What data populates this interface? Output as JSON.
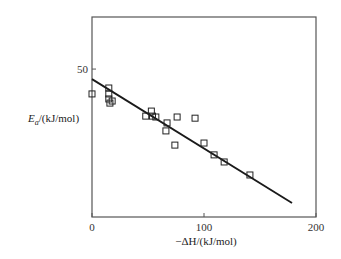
{
  "chart_data": {
    "type": "scatter",
    "title": "",
    "xlabel": "−ΔH/(kJ/mol)",
    "ylabel_main": "E",
    "ylabel_sub": "a",
    "ylabel_rest": "/(kJ/mol)",
    "xlim": [
      0,
      200
    ],
    "ylim": [
      0,
      67.6
    ],
    "x_ticks": [
      0,
      100,
      200
    ],
    "x_tick_labels": [
      "0",
      "100",
      "200"
    ],
    "y_ticks": [
      50
    ],
    "y_tick_labels": [
      "50"
    ],
    "grid": false,
    "legend": null,
    "series": [
      {
        "name": "data",
        "marker": "open-square",
        "points": [
          {
            "x": 0,
            "y": 41.6
          },
          {
            "x": 15,
            "y": 43.6
          },
          {
            "x": 15,
            "y": 41.6
          },
          {
            "x": 15,
            "y": 39.9
          },
          {
            "x": 18,
            "y": 39.2
          },
          {
            "x": 16,
            "y": 38.5
          },
          {
            "x": 48,
            "y": 34.1
          },
          {
            "x": 53,
            "y": 35.8
          },
          {
            "x": 54,
            "y": 34.1
          },
          {
            "x": 57,
            "y": 33.8
          },
          {
            "x": 67,
            "y": 31.8
          },
          {
            "x": 66,
            "y": 29.1
          },
          {
            "x": 76,
            "y": 33.8
          },
          {
            "x": 92,
            "y": 33.4
          },
          {
            "x": 74,
            "y": 24.3
          },
          {
            "x": 100,
            "y": 25.0
          },
          {
            "x": 109,
            "y": 21.0
          },
          {
            "x": 118,
            "y": 18.6
          },
          {
            "x": 141,
            "y": 14.2
          }
        ]
      },
      {
        "name": "fit",
        "type": "line",
        "points": [
          {
            "x": 0,
            "y": 46.6
          },
          {
            "x": 178.6,
            "y": 4.7
          }
        ]
      }
    ]
  },
  "colors": {
    "axis": "#555555",
    "line": "#1a1a1a",
    "marker": "#222222",
    "background": "#ffffff"
  }
}
